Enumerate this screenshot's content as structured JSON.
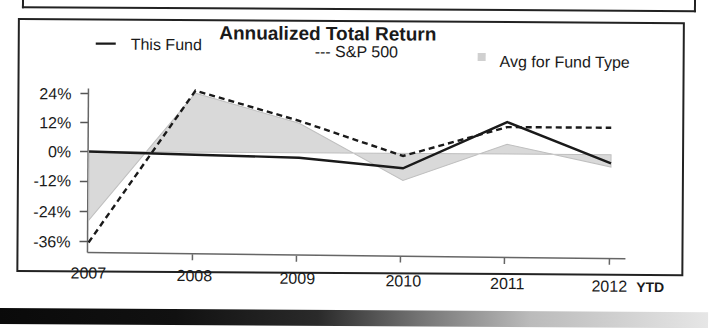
{
  "chart_data": {
    "type": "line",
    "title": "Annualized Total Return",
    "xlabel": "",
    "ylabel": "",
    "categories": [
      "2007",
      "2008",
      "2009",
      "2010",
      "2011",
      "2012"
    ],
    "x_suffix_label": "YTD",
    "yticks": [
      "24%",
      "12%",
      "0%",
      "-12%",
      "-24%",
      "-36%"
    ],
    "ytick_values": [
      24,
      12,
      0,
      -12,
      -24,
      -36
    ],
    "ylim": [
      -36,
      24
    ],
    "grid": false,
    "legend_position": "top",
    "series": [
      {
        "name": "This Fund",
        "style": "solid",
        "legend_label": "This Fund",
        "values": [
          0,
          -1,
          -2,
          -6,
          13,
          -3.5
        ]
      },
      {
        "name": "S&P 500",
        "style": "dashed",
        "legend_label": "--- S&P 500",
        "values": [
          -37,
          25,
          13,
          -1,
          11,
          11
        ]
      },
      {
        "name": "Avg for Fund Type",
        "style": "area",
        "legend_label": "Avg for Fund Type",
        "values": [
          -28,
          24,
          12,
          -11,
          4,
          -5
        ]
      }
    ]
  },
  "colors": {
    "line": "#1a1a1a",
    "area_fill": "#d9d9d9",
    "area_edge": "#bfbfbf",
    "frame": "#222222"
  }
}
